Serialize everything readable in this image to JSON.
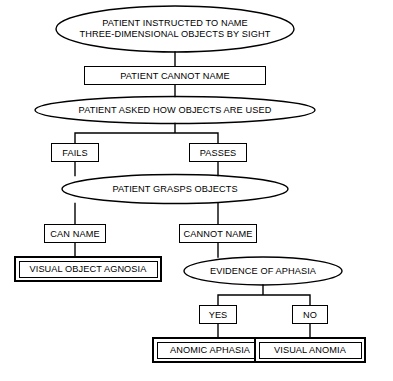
{
  "diagram": {
    "type": "flowchart",
    "line_color": "#000000",
    "background_color": "#ffffff",
    "nodes": {
      "start": {
        "shape": "ellipse",
        "label": "PATIENT INSTRUCTED TO NAME\nTHREE-DIMENSIONAL OBJECTS BY SIGHT"
      },
      "cannot_name": {
        "shape": "box",
        "label": "PATIENT CANNOT NAME"
      },
      "asked_how_used": {
        "shape": "ellipse",
        "label": "PATIENT ASKED HOW OBJECTS ARE USED"
      },
      "fails": {
        "shape": "box",
        "label": "FAILS"
      },
      "passes": {
        "shape": "box",
        "label": "PASSES"
      },
      "grasps_objects": {
        "shape": "ellipse",
        "label": "PATIENT GRASPS OBJECTS"
      },
      "can_name": {
        "shape": "box",
        "label": "CAN NAME"
      },
      "cannot_name_2": {
        "shape": "box",
        "label": "CANNOT NAME"
      },
      "visual_object_agnosia": {
        "shape": "terminal-box",
        "label": "VISUAL OBJECT AGNOSIA"
      },
      "evidence_of_aphasia": {
        "shape": "ellipse",
        "label": "EVIDENCE OF APHASIA"
      },
      "yes": {
        "shape": "box",
        "label": "YES"
      },
      "no": {
        "shape": "box",
        "label": "NO"
      },
      "anomic_aphasia": {
        "shape": "terminal-box",
        "label": "ANOMIC APHASIA"
      },
      "visual_anomia": {
        "shape": "terminal-box",
        "label": "VISUAL ANOMIA"
      }
    },
    "edges": [
      {
        "from": "start",
        "to": "cannot_name"
      },
      {
        "from": "cannot_name",
        "to": "asked_how_used"
      },
      {
        "from": "asked_how_used",
        "to": "fails"
      },
      {
        "from": "asked_how_used",
        "to": "passes"
      },
      {
        "from": "fails",
        "to": "grasps_objects"
      },
      {
        "from": "passes",
        "to": "grasps_objects"
      },
      {
        "from": "grasps_objects",
        "to": "can_name"
      },
      {
        "from": "grasps_objects",
        "to": "cannot_name_2"
      },
      {
        "from": "can_name",
        "to": "visual_object_agnosia"
      },
      {
        "from": "cannot_name_2",
        "to": "evidence_of_aphasia"
      },
      {
        "from": "evidence_of_aphasia",
        "to": "yes"
      },
      {
        "from": "evidence_of_aphasia",
        "to": "no"
      },
      {
        "from": "yes",
        "to": "anomic_aphasia"
      },
      {
        "from": "no",
        "to": "visual_anomia"
      }
    ]
  }
}
